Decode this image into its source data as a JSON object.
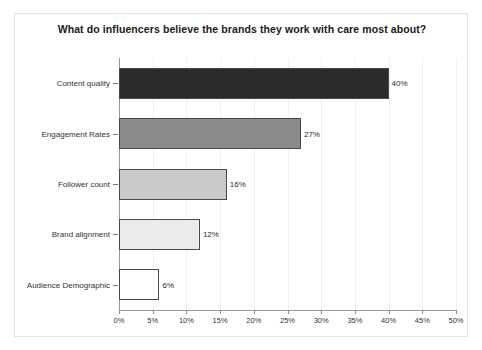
{
  "chart_data": {
    "type": "bar",
    "orientation": "horizontal",
    "title": "What do influencers believe the brands they work with care most about?",
    "xlabel": "",
    "ylabel": "",
    "categories": [
      "Content quality",
      "Engagement Rates",
      "Follower count",
      "Brand alignment",
      "Audience Demographic"
    ],
    "values": [
      40,
      27,
      16,
      12,
      6
    ],
    "data_labels": [
      "40%",
      "27%",
      "16%",
      "12%",
      "6%"
    ],
    "bar_colors": [
      "#2b2b2b",
      "#8a8a8a",
      "#c9c9c9",
      "#ebebeb",
      "#ffffff"
    ],
    "bar_edge_color": "#4a4a4a",
    "xlim": [
      0,
      50
    ],
    "xticks": [
      0,
      5,
      10,
      15,
      20,
      25,
      30,
      35,
      40,
      45,
      50
    ],
    "xtick_labels": [
      "0%",
      "5%",
      "10%",
      "15%",
      "20%",
      "25%",
      "30%",
      "35%",
      "40%",
      "45%",
      "50%"
    ],
    "grid": true,
    "legend": false,
    "background": "#ffffff",
    "border_color": "#e2e2e2"
  }
}
